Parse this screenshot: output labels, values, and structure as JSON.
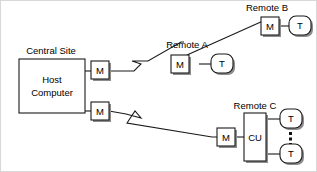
{
  "diagram": {
    "type": "network-topology",
    "background_color": "#ffffff",
    "line_color": "#1a1a1a",
    "shadow_color": "#8c8c8c",
    "groups": {
      "central_site": {
        "label": "Central Site",
        "host": {
          "label_line1": "Host",
          "label_line2": "Computer"
        },
        "modem_top": {
          "label": "M"
        },
        "modem_bottom": {
          "label": "M"
        }
      },
      "remote_a": {
        "label": "Remote A",
        "modem": {
          "label": "M"
        },
        "terminal": {
          "label": "T"
        }
      },
      "remote_b": {
        "label": "Remote B",
        "modem": {
          "label": "M"
        },
        "terminal": {
          "label": "T"
        }
      },
      "remote_c": {
        "label": "Remote C",
        "modem": {
          "label": "M"
        },
        "cluster_unit": {
          "label": "CU"
        },
        "terminal_top": {
          "label": "T"
        },
        "terminal_bottom": {
          "label": "T"
        },
        "ellipsis": "⋮"
      }
    }
  }
}
